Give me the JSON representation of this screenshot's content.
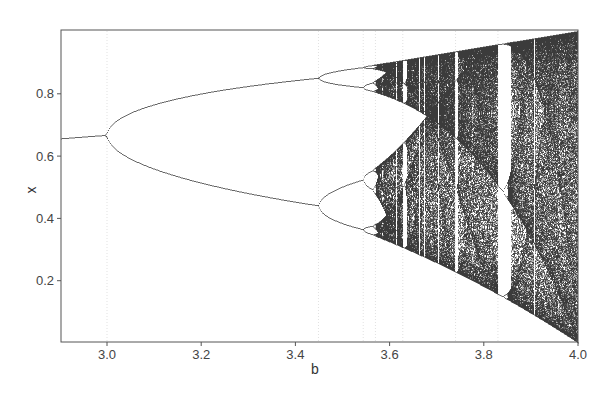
{
  "chart_data": {
    "type": "scatter",
    "title": "",
    "subtitle": "Bifurcation diagram of the logistic map x(n+1) = b·x(n)·(1−x(n))",
    "xlabel": "b",
    "ylabel": "x",
    "xlim": [
      2.9,
      4.0
    ],
    "ylim": [
      0.0,
      1.0
    ],
    "xticks": [
      3.0,
      3.2,
      3.4,
      3.6,
      3.8,
      4.0
    ],
    "xtick_labels": [
      "3.0",
      "3.2",
      "3.4",
      "3.6",
      "3.8",
      "4.0"
    ],
    "yticks": [
      0.2,
      0.4,
      0.6,
      0.8
    ],
    "ytick_labels": [
      "0.2",
      "0.4",
      "0.6",
      "0.8"
    ],
    "grid": false,
    "legend": null,
    "series": [
      {
        "name": "attractor points",
        "color": "#111111",
        "description": "long-run values of x for each b",
        "key_points": [
          {
            "b": 2.9,
            "x": [
              0.655
            ]
          },
          {
            "b": 3.0,
            "x": [
              0.667
            ]
          },
          {
            "b": 3.2,
            "x": [
              0.513,
              0.799
            ]
          },
          {
            "b": 3.449,
            "x": [
              0.44,
              0.852
            ]
          },
          {
            "b": 3.5,
            "x": [
              0.383,
              0.501,
              0.827,
              0.875
            ]
          },
          {
            "b": 3.544,
            "x": [
              0.37,
              0.52,
              0.82,
              0.885
            ]
          },
          {
            "b": 3.5699,
            "x": "onset of chaos"
          },
          {
            "b": 3.83,
            "x": [
              0.156,
              0.505,
              0.957
            ],
            "note": "period-3 window"
          },
          {
            "b": 4.0,
            "x": "chaotic band [0, 1]"
          }
        ]
      }
    ],
    "annotations": [
      {
        "b": 3.0,
        "text": "period-doubling bifurcation (dotted guide)"
      },
      {
        "b": 3.449,
        "text": "period-4 onset (dotted guide)"
      },
      {
        "b": 3.544,
        "text": "period-8 onset (dotted guide)"
      },
      {
        "b": 3.5699,
        "text": "onset of chaos (dotted guide)"
      },
      {
        "b": 3.628,
        "text": "period-6 window (dotted guide)"
      },
      {
        "b": 3.74,
        "text": "period-5 window (dotted guide)"
      },
      {
        "b": 3.83,
        "text": "period-3 window (dotted guide)"
      }
    ]
  },
  "plot": {
    "frame_color": "#555555",
    "ink_color": "#1a1a1a"
  }
}
